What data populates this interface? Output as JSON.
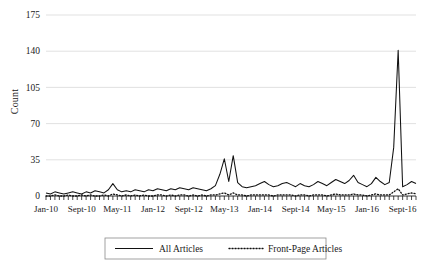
{
  "chart_data": {
    "type": "line",
    "title": "",
    "xlabel": "",
    "ylabel": "Count",
    "ylim": [
      0,
      175
    ],
    "yticks": [
      0,
      35,
      70,
      105,
      140,
      175
    ],
    "grid": true,
    "legend_position": "bottom",
    "x_tick_labels": [
      "Jan-10",
      "Sept-10",
      "May-11",
      "Jan-12",
      "Sept-12",
      "May-13",
      "Jan-14",
      "Sept-14",
      "May-15",
      "Jan-16",
      "Sept-16"
    ],
    "x_tick_indices": [
      0,
      8,
      16,
      24,
      32,
      40,
      48,
      56,
      64,
      72,
      80
    ],
    "x_start": "Jan-10",
    "x_end": "Dec-16",
    "x_interval": "monthly",
    "n_points": 84,
    "series": [
      {
        "name": "All Articles",
        "style": "solid",
        "color": "#111111",
        "values": [
          3,
          2,
          4,
          3,
          2,
          3,
          4,
          3,
          2,
          4,
          3,
          5,
          4,
          3,
          6,
          12,
          6,
          4,
          5,
          4,
          6,
          5,
          4,
          6,
          5,
          7,
          6,
          5,
          7,
          6,
          8,
          7,
          6,
          8,
          7,
          6,
          5,
          7,
          10,
          21,
          36,
          14,
          39,
          13,
          9,
          8,
          9,
          10,
          12,
          14,
          11,
          9,
          10,
          12,
          13,
          11,
          9,
          12,
          10,
          9,
          11,
          14,
          12,
          10,
          13,
          16,
          14,
          12,
          15,
          20,
          13,
          11,
          9,
          12,
          18,
          14,
          11,
          13,
          47,
          141,
          9,
          11,
          14,
          12
        ]
      },
      {
        "name": "Front-Page Articles",
        "style": "dotted",
        "color": "#111111",
        "values": [
          0,
          0,
          1,
          0,
          0,
          1,
          0,
          0,
          1,
          0,
          1,
          0,
          0,
          1,
          0,
          2,
          1,
          0,
          1,
          0,
          1,
          0,
          1,
          0,
          0,
          1,
          1,
          0,
          1,
          0,
          1,
          1,
          0,
          1,
          0,
          1,
          0,
          1,
          1,
          2,
          3,
          1,
          3,
          1,
          1,
          0,
          1,
          1,
          1,
          1,
          1,
          0,
          1,
          1,
          1,
          1,
          0,
          1,
          1,
          0,
          1,
          1,
          1,
          0,
          1,
          2,
          1,
          1,
          1,
          2,
          1,
          1,
          0,
          1,
          2,
          1,
          1,
          1,
          4,
          7,
          1,
          2,
          3,
          2
        ]
      }
    ]
  },
  "legend": {
    "items": [
      {
        "label": "All Articles",
        "style": "solid"
      },
      {
        "label": "Front-Page Articles",
        "style": "dotted"
      }
    ]
  }
}
